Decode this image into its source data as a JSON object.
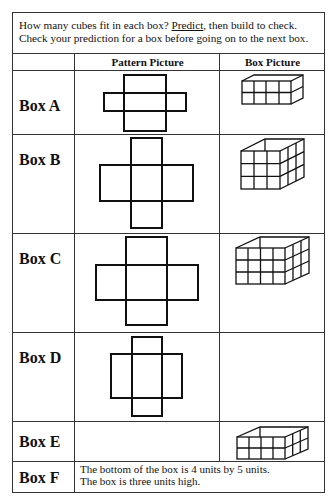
{
  "intro": {
    "line1_before": "How many cubes fit in each box?  ",
    "line1_underlined": "Predict",
    "line1_after": ", then build to check.",
    "line2": "Check your prediction for a box before going on to the next box."
  },
  "table": {
    "headers": [
      "",
      "Pattern Picture",
      "Box Picture"
    ],
    "rows": [
      {
        "label": "Box A",
        "pattern": "cross net, 4 flaps",
        "box": "4x1x2 open box"
      },
      {
        "label": "Box B",
        "pattern": "cross net, 4 flaps",
        "box": "3x3x3 open box"
      },
      {
        "label": "Box C",
        "pattern": "cross net, 4 flaps",
        "box": "4x3x3 open box"
      },
      {
        "label": "Box D",
        "pattern": "cross net, 4 flaps",
        "box": ""
      },
      {
        "label": "Box E",
        "pattern": "",
        "box": "4x3x2 open box"
      },
      {
        "label": "Box F",
        "description_line1": "The bottom of the box is 4 units by 5 units.",
        "description_line2": "The box is three units high."
      }
    ]
  }
}
